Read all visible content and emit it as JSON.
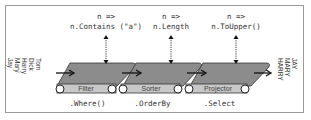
{
  "diagram": {
    "input_names": [
      "Tom",
      "Dick",
      "Harry",
      "Mary",
      "Jay"
    ],
    "output_names": [
      "JAY",
      "MARY",
      "HARRY"
    ],
    "stages": [
      {
        "lambda_head": "n =>",
        "lambda_body": "n.Contains (\"a\")",
        "belt_label": "Filter",
        "method": ".Where()"
      },
      {
        "lambda_head": "n =>",
        "lambda_body": "n.Length",
        "belt_label": "Sorter",
        "method": ".OrderBy"
      },
      {
        "lambda_head": "n =>",
        "lambda_body": "n.ToUpper()",
        "belt_label": "Projector",
        "method": ".Select"
      }
    ],
    "colors": {
      "belt_top": "#8c8c8c",
      "belt_band": "#c8c8c8",
      "frame": "#9a9a9a",
      "arrow": "#111111"
    }
  }
}
